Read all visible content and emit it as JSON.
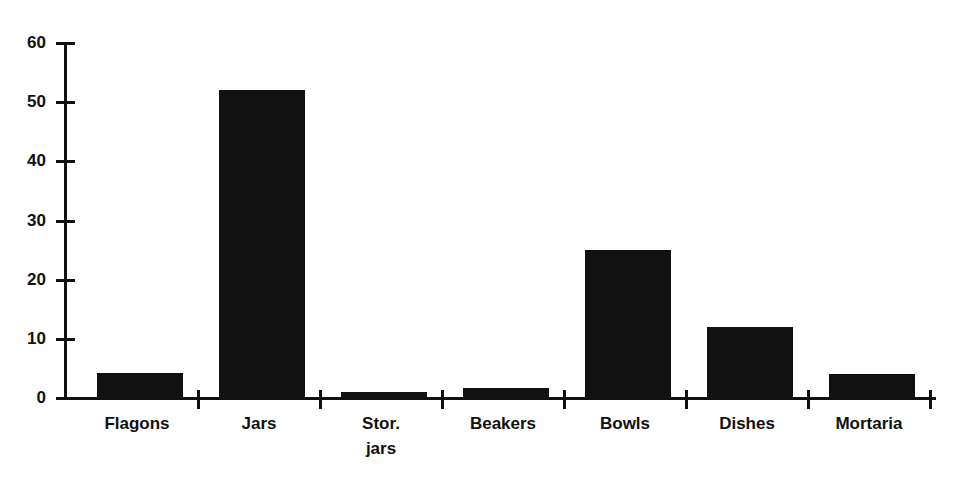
{
  "chart_data": {
    "type": "bar",
    "title": "",
    "xlabel": "",
    "ylabel": "",
    "categories": [
      "Flagons",
      "Jars",
      "Stor.\njars",
      "Beakers",
      "Bowls",
      "Dishes",
      "Mortaria"
    ],
    "category_labels_flat": [
      "Flagons",
      "Jars",
      "Stor. jars",
      "Beakers",
      "Bowls",
      "Dishes",
      "Mortaria"
    ],
    "values": [
      4.2,
      52,
      1,
      1.7,
      25,
      12,
      4
    ],
    "ylim": [
      0,
      60
    ],
    "y_ticks": [
      0,
      10,
      20,
      30,
      40,
      50,
      60
    ],
    "y_tick_labels": [
      "0",
      "10",
      "20",
      "30",
      "40",
      "50",
      "60"
    ],
    "grid": false,
    "legend": false,
    "bar_color": "#111111",
    "background_color": "#ffffff",
    "axis_color": "#111111"
  }
}
